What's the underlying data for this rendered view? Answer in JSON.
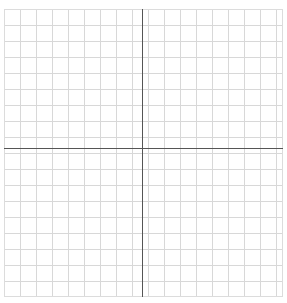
{
  "figure": {
    "kind": "cartesian-grid",
    "title": "",
    "background_color": "#ffffff"
  },
  "chart_data": {
    "type": "scatter",
    "title": "",
    "subtitle": "",
    "xlabel": "",
    "ylabel": "",
    "series": [],
    "x": [],
    "values": [],
    "annotations": [],
    "legend": {
      "visible": false,
      "position": "none",
      "entries": []
    },
    "grid": {
      "visible": true,
      "major_spacing_px": 16,
      "minor_spacing_px": 16,
      "columns": 17,
      "rows": 18,
      "major_color": "#d6d6d6",
      "minor_color": "#e9e9e9",
      "border_color": "#dcdcdc"
    },
    "axes": {
      "visible": true,
      "color": "#555555",
      "line_width_px": 1.4,
      "x_axis_y_px": 148,
      "y_axis_x_px": 142,
      "xlim": [
        -9,
        8
      ],
      "ylim": [
        -9,
        9
      ],
      "xticks": [],
      "yticks": [],
      "xticklabels": [],
      "yticklabels": [],
      "origin_label": ""
    },
    "plot_area": {
      "left_px": 4,
      "top_px": 9,
      "width_px": 279,
      "height_px": 288
    }
  }
}
